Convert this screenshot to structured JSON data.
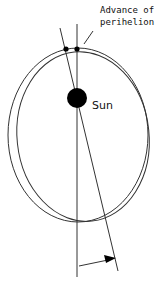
{
  "diagram": {
    "title": "Advance of perihelion",
    "labels": {
      "annotation_line1": "Advance of",
      "annotation_line2": "perihelion",
      "sun": "Sun"
    },
    "colors": {
      "stroke": "#222222",
      "sun_fill": "#000000",
      "background": "#ffffff"
    }
  }
}
